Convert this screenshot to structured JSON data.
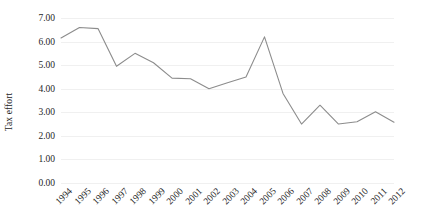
{
  "chart_data": {
    "type": "line",
    "title": "",
    "xlabel": "",
    "ylabel": "Tax effort",
    "categories": [
      "1994",
      "1995",
      "1996",
      "1997",
      "1998",
      "1999",
      "2000",
      "2001",
      "2002",
      "2003",
      "2004",
      "2005",
      "2006",
      "2007",
      "2008",
      "2009",
      "2010",
      "2011",
      "2012"
    ],
    "values": [
      6.15,
      6.6,
      6.55,
      4.95,
      5.5,
      5.1,
      4.45,
      4.42,
      4.0,
      4.25,
      4.5,
      6.2,
      3.8,
      2.5,
      3.3,
      2.5,
      2.6,
      3.02,
      2.58
    ],
    "series": [
      {
        "name": "Tax effort",
        "values": [
          6.15,
          6.6,
          6.55,
          4.95,
          5.5,
          5.1,
          4.45,
          4.42,
          4.0,
          4.25,
          4.5,
          6.2,
          3.8,
          2.5,
          3.3,
          2.5,
          2.6,
          3.02,
          2.58
        ]
      }
    ],
    "ylim": [
      0,
      7
    ],
    "ytick_labels": [
      "0.00",
      "1.00",
      "2.00",
      "3.00",
      "4.00",
      "5.00",
      "6.00",
      "7.00"
    ],
    "ytick_values": [
      0,
      1,
      2,
      3,
      4,
      5,
      6,
      7
    ],
    "grid": true,
    "legend": "none",
    "line_color": "#8c8c8c",
    "gridline_color": "#f0f0f0",
    "background_color": "#ffffff",
    "markers": false
  }
}
